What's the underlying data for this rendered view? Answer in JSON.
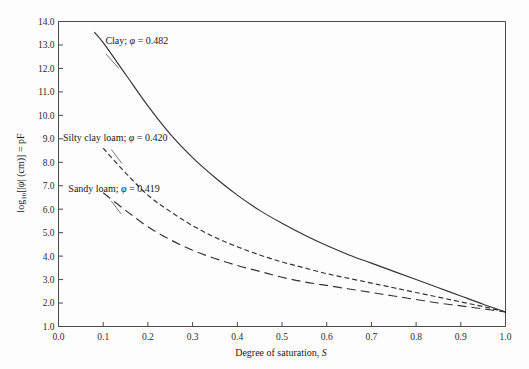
{
  "chart_data": {
    "type": "line",
    "title": "",
    "xlabel": "Degree of saturation, S",
    "ylabel": "log10[|ψ| (cm)] = pF",
    "xlim": [
      0.0,
      1.0
    ],
    "ylim": [
      1.0,
      14.0
    ],
    "grid": false,
    "legend_position": "inline-annotations",
    "xticks": [
      "0.0",
      "0.1",
      "0.2",
      "0.3",
      "0.4",
      "0.5",
      "0.6",
      "0.7",
      "0.8",
      "0.9",
      "1.0"
    ],
    "xtick_values": [
      0.0,
      0.1,
      0.2,
      0.3,
      0.4,
      0.5,
      0.6,
      0.7,
      0.8,
      0.9,
      1.0
    ],
    "yticks": [
      "1.0",
      "2.0",
      "3.0",
      "4.0",
      "5.0",
      "6.0",
      "7.0",
      "8.0",
      "9.0",
      "10.0",
      "11.0",
      "12.0",
      "13.0",
      "14.0"
    ],
    "ytick_values": [
      1.0,
      2.0,
      3.0,
      4.0,
      5.0,
      6.0,
      7.0,
      8.0,
      9.0,
      10.0,
      11.0,
      12.0,
      13.0,
      14.0
    ],
    "series": [
      {
        "name": "Clay",
        "label": "Clay; φ = 0.482",
        "porosity": 0.482,
        "style": "solid",
        "dasharray": "none",
        "color": "#333333",
        "x": [
          0.08,
          0.1,
          0.15,
          0.2,
          0.25,
          0.3,
          0.35,
          0.4,
          0.45,
          0.5,
          0.55,
          0.6,
          0.65,
          0.7,
          0.75,
          0.8,
          0.85,
          0.9,
          0.95,
          1.0
        ],
        "y": [
          13.55,
          13.1,
          11.75,
          10.4,
          9.2,
          8.2,
          7.35,
          6.6,
          5.95,
          5.4,
          4.9,
          4.45,
          4.05,
          3.7,
          3.35,
          3.0,
          2.65,
          2.3,
          1.95,
          1.62
        ]
      },
      {
        "name": "Silty clay loam",
        "label": "Silty clay loam; φ = 0.420",
        "porosity": 0.42,
        "style": "short-dash",
        "dasharray": "5,3",
        "color": "#444444",
        "x": [
          0.1,
          0.15,
          0.2,
          0.25,
          0.3,
          0.35,
          0.4,
          0.45,
          0.5,
          0.55,
          0.6,
          0.65,
          0.7,
          0.75,
          0.8,
          0.85,
          0.9,
          0.95,
          1.0
        ],
        "y": [
          8.6,
          7.55,
          6.6,
          5.9,
          5.3,
          4.8,
          4.4,
          4.05,
          3.75,
          3.5,
          3.25,
          3.05,
          2.85,
          2.65,
          2.45,
          2.25,
          2.05,
          1.85,
          1.62
        ]
      },
      {
        "name": "Sandy loam",
        "label": "Sandy loam; φ = 0.419",
        "porosity": 0.419,
        "style": "long-dash",
        "dasharray": "9,5",
        "color": "#444444",
        "x": [
          0.1,
          0.15,
          0.2,
          0.25,
          0.3,
          0.35,
          0.4,
          0.45,
          0.5,
          0.55,
          0.6,
          0.65,
          0.7,
          0.75,
          0.8,
          0.85,
          0.9,
          0.95,
          1.0
        ],
        "y": [
          6.7,
          5.95,
          5.25,
          4.7,
          4.25,
          3.9,
          3.6,
          3.35,
          3.1,
          2.9,
          2.75,
          2.6,
          2.45,
          2.3,
          2.15,
          2.0,
          1.88,
          1.75,
          1.62
        ]
      }
    ],
    "annotations": [
      {
        "id": "clay-annotation",
        "text_prefix": "Clay; ",
        "symbol": "φ",
        "text_suffix": " = 0.482",
        "text_full": "Clay; φ = 0.482",
        "text_x": 0.105,
        "text_y": 13.05,
        "leader_from": [
          0.106,
          12.62
        ],
        "leader_to": [
          0.135,
          12.0
        ]
      },
      {
        "id": "silty-clay-loam-annotation",
        "text_prefix": "Silty clay loam; ",
        "symbol": "φ",
        "text_suffix": " = 0.420",
        "text_full": "Silty clay loam; φ = 0.420",
        "text_x": 0.01,
        "text_y": 8.92,
        "leader_from": [
          0.118,
          8.55
        ],
        "leader_to": [
          0.142,
          7.95
        ]
      },
      {
        "id": "sandy-loam-annotation",
        "text_prefix": "Sandy loam; ",
        "symbol": "φ",
        "text_suffix": " = 0.419",
        "text_full": "Sandy loam; φ = 0.419",
        "text_x": 0.022,
        "text_y": 6.72,
        "leader_from": [
          0.118,
          6.35
        ],
        "leader_to": [
          0.14,
          5.8
        ]
      }
    ]
  },
  "axis": {
    "y_label_parts": {
      "log_text": "log",
      "log_sub": "10",
      "bracket_open": "[|",
      "psi": "ψ",
      "units": "| (cm)] = pF"
    },
    "x_label_parts": {
      "main": "Degree of saturation, ",
      "italic_symbol": "S"
    }
  },
  "colors": {
    "background": "#fdfdfd",
    "axis": "#4a4a4a",
    "curve": "#333333",
    "text": "#1a1a1a"
  }
}
